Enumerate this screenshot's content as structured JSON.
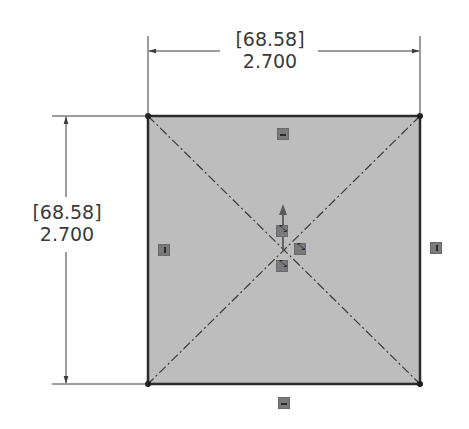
{
  "sketch": {
    "shape": "square",
    "fill_color": "#bdbdbd",
    "edge_color": "#2b2b2b",
    "construction_line_color": "#3a3a3a",
    "corners": [
      {
        "name": "top-left",
        "x": 148,
        "y": 116
      },
      {
        "name": "top-right",
        "x": 420,
        "y": 116
      },
      {
        "name": "bottom-right",
        "x": 420,
        "y": 384
      },
      {
        "name": "bottom-left",
        "x": 148,
        "y": 384
      }
    ],
    "center": {
      "x": 284,
      "y": 250
    }
  },
  "dimensions": {
    "horizontal": {
      "metric": "[68.58]",
      "imperial": "2.700"
    },
    "vertical": {
      "metric": "[68.58]",
      "imperial": "2.700"
    }
  },
  "relations": {
    "top_edge": "horizontal",
    "bottom_edge": "horizontal",
    "left_edge": "vertical",
    "right_edge": "vertical",
    "origin": [
      "coincident",
      "midpoint",
      "coincident"
    ]
  },
  "icons": {
    "horizontal_relation": "horizontal-relation-icon",
    "vertical_relation": "vertical-relation-icon",
    "coincident_relation": "coincident-relation-icon",
    "origin": "origin-arrow-icon"
  }
}
